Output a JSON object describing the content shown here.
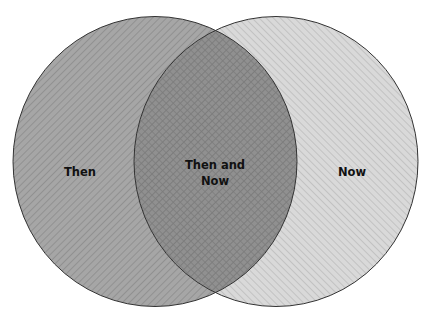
{
  "diagram": {
    "type": "venn",
    "sets": [
      {
        "id": "then",
        "label": "Then",
        "cx": 155,
        "cy": 161.5,
        "rx": 142,
        "ry": 145,
        "fill": "#a6a6a6",
        "hatch_color": "#8c8c8c",
        "hatch_direction": "backslash"
      },
      {
        "id": "now",
        "label": "Now",
        "cx": 276,
        "cy": 161.5,
        "rx": 142,
        "ry": 145,
        "fill": "#d9d9d9",
        "hatch_color": "#bdbdbd",
        "hatch_direction": "slash"
      }
    ],
    "intersection": {
      "label": "Then and Now",
      "fill": "#8f8f8f",
      "hatch_color": "#777777",
      "hatch_direction": "cross"
    },
    "outline_color": "#333333"
  },
  "labels": {
    "then": "Then",
    "overlap": "Then and Now",
    "now": "Now"
  }
}
